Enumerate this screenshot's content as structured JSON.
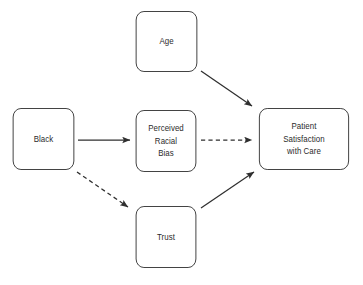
{
  "diagram": {
    "type": "path-diagram",
    "background_color": "#ffffff",
    "node_border_color": "#3b3b3b",
    "node_fill_color": "#ffffff",
    "edge_color": "#2f2f2f",
    "text_color": "#2b2b2b",
    "nodes": [
      {
        "id": "age",
        "lines": [
          "Age"
        ],
        "x": 133,
        "y": 11,
        "w": 67,
        "h": 61
      },
      {
        "id": "black",
        "lines": [
          "Black"
        ],
        "x": 10,
        "y": 108,
        "w": 67,
        "h": 62
      },
      {
        "id": "bias",
        "lines": [
          "Perceived",
          "Racial",
          "Bias"
        ],
        "x": 133,
        "y": 110,
        "w": 66,
        "h": 62
      },
      {
        "id": "satisfaction",
        "lines": [
          "Patient",
          "Satisfaction",
          "with Care"
        ],
        "x": 255,
        "y": 108,
        "w": 98,
        "h": 62
      },
      {
        "id": "trust",
        "lines": [
          "Trust"
        ],
        "x": 133,
        "y": 206,
        "w": 66,
        "h": 62
      }
    ],
    "edges": [
      {
        "id": "age-to-satisfaction",
        "from": "age",
        "to": "satisfaction",
        "style": "solid",
        "x1": 201,
        "y1": 71,
        "x2": 252,
        "y2": 106
      },
      {
        "id": "black-to-bias",
        "from": "black",
        "to": "bias",
        "style": "solid",
        "x1": 78,
        "y1": 140,
        "x2": 130,
        "y2": 140
      },
      {
        "id": "bias-to-satisfaction",
        "from": "bias",
        "to": "satisfaction",
        "style": "dashed",
        "x1": 201,
        "y1": 140,
        "x2": 252,
        "y2": 140
      },
      {
        "id": "black-to-trust",
        "from": "black",
        "to": "trust",
        "style": "dashed",
        "x1": 77,
        "y1": 172,
        "x2": 128,
        "y2": 207
      },
      {
        "id": "trust-to-satisfaction",
        "from": "trust",
        "to": "satisfaction",
        "style": "solid",
        "x1": 201,
        "y1": 208,
        "x2": 254,
        "y2": 172
      }
    ]
  }
}
